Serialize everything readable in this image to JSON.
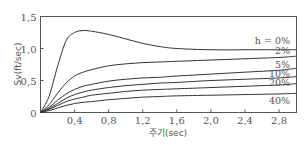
{
  "chart_data": {
    "type": "line",
    "title": "",
    "xlabel": "주기(sec)",
    "ylabel": "Sv(ft/sec)",
    "xlim": [
      0,
      3.0
    ],
    "ylim": [
      0,
      1.5
    ],
    "x_ticks": [
      "0.4",
      "0.8",
      "1.2",
      "1.6",
      "2.0",
      "2.4",
      "2.8"
    ],
    "x_tick_values": [
      0.4,
      0.8,
      1.2,
      1.6,
      2.0,
      2.4,
      2.8
    ],
    "y_ticks": [
      "0",
      "0.5",
      "1.0",
      "1.5"
    ],
    "y_tick_values": [
      0,
      0.5,
      1.0,
      1.5
    ],
    "grid": false,
    "legend_position": "inline-right",
    "x": [
      0,
      0.1,
      0.2,
      0.3,
      0.4,
      0.5,
      0.6,
      0.8,
      1.0,
      1.2,
      1.4,
      1.6,
      2.0,
      2.4,
      2.8,
      3.0
    ],
    "series": [
      {
        "name": "h=0%",
        "label": "h = 0%",
        "values": [
          0,
          0.25,
          0.72,
          1.12,
          1.25,
          1.28,
          1.27,
          1.22,
          1.15,
          1.08,
          1.03,
          1.0,
          0.98,
          0.98,
          0.98,
          0.98
        ]
      },
      {
        "name": "h=2%",
        "label": "2%",
        "values": [
          0,
          0.12,
          0.3,
          0.46,
          0.57,
          0.63,
          0.67,
          0.73,
          0.76,
          0.78,
          0.79,
          0.8,
          0.82,
          0.84,
          0.86,
          0.88
        ]
      },
      {
        "name": "h=5%",
        "label": "5%",
        "values": [
          0,
          0.08,
          0.19,
          0.29,
          0.36,
          0.41,
          0.44,
          0.49,
          0.52,
          0.54,
          0.55,
          0.57,
          0.6,
          0.63,
          0.66,
          0.69
        ]
      },
      {
        "name": "h=10%",
        "label": "10%",
        "values": [
          0,
          0.06,
          0.14,
          0.22,
          0.28,
          0.32,
          0.35,
          0.39,
          0.42,
          0.44,
          0.46,
          0.47,
          0.5,
          0.52,
          0.54,
          0.56
        ]
      },
      {
        "name": "h=20%",
        "label": "20%",
        "values": [
          0,
          0.05,
          0.11,
          0.17,
          0.21,
          0.24,
          0.27,
          0.3,
          0.33,
          0.35,
          0.36,
          0.37,
          0.39,
          0.41,
          0.43,
          0.45
        ]
      },
      {
        "name": "h=40%",
        "label": "40%",
        "values": [
          0,
          0.03,
          0.07,
          0.11,
          0.14,
          0.16,
          0.17,
          0.2,
          0.22,
          0.24,
          0.25,
          0.26,
          0.27,
          0.28,
          0.29,
          0.3
        ]
      }
    ]
  },
  "labels": {
    "origin": "0",
    "xlabel": "주기(sec)",
    "ylabel": "Sv(ft/sec)"
  }
}
